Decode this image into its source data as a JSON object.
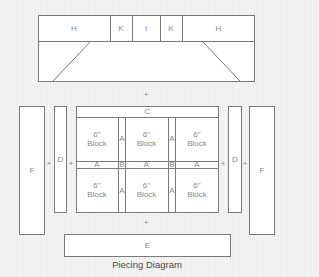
{
  "diagram": {
    "caption": "Piecing Diagram",
    "colors": {
      "background": "#efefef",
      "piece_fill": "#ffffff",
      "line": "#7a7a7a",
      "label": "#8a8a8a",
      "caption": "#4a4a4a"
    },
    "top_border": {
      "strip_labels": [
        "H",
        "K",
        "I",
        "K",
        "H"
      ],
      "lower_panel_label": ""
    },
    "plus": "+",
    "side_left": {
      "outer": "F",
      "inner": "D"
    },
    "side_right": {
      "inner": "D",
      "outer": "F"
    },
    "center": {
      "top_strip": "C",
      "block_size": "6\"",
      "block_word": "Block",
      "vertical_sashing": "A",
      "horizontal_sashing": [
        "A",
        "B",
        "A",
        "B",
        "A"
      ]
    },
    "bottom_border": "E"
  }
}
